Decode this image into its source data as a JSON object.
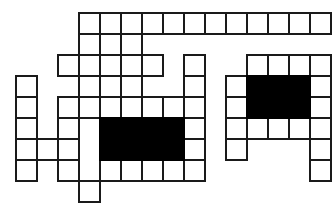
{
  "puzzle": {
    "kind": "crossword-grid",
    "title": "Blank Crossword Puzzle Grid",
    "colors": {
      "background": "#ffffff",
      "cell_fill": "#ffffff",
      "cell_border": "#1a1a1a",
      "blocked_cell": "#000000"
    },
    "geometry": {
      "image_width": 331,
      "image_height": 200,
      "cell_size": 21,
      "origin_x": 15,
      "origin_y": 12,
      "columns": 15,
      "rows": 9,
      "border_width": 2
    },
    "counts": {
      "open_cells": 66,
      "blocked_cells": 16,
      "total_drawn_cells": 82
    },
    "cells": [
      {
        "row": 0,
        "col": 3,
        "state": "open"
      },
      {
        "row": 0,
        "col": 4,
        "state": "open"
      },
      {
        "row": 0,
        "col": 5,
        "state": "open"
      },
      {
        "row": 0,
        "col": 6,
        "state": "open"
      },
      {
        "row": 0,
        "col": 7,
        "state": "open"
      },
      {
        "row": 0,
        "col": 8,
        "state": "open"
      },
      {
        "row": 0,
        "col": 9,
        "state": "open"
      },
      {
        "row": 0,
        "col": 10,
        "state": "open"
      },
      {
        "row": 0,
        "col": 11,
        "state": "open"
      },
      {
        "row": 0,
        "col": 12,
        "state": "open"
      },
      {
        "row": 0,
        "col": 13,
        "state": "open"
      },
      {
        "row": 0,
        "col": 14,
        "state": "open"
      },
      {
        "row": 1,
        "col": 3,
        "state": "open"
      },
      {
        "row": 1,
        "col": 5,
        "state": "open"
      },
      {
        "row": 2,
        "col": 2,
        "state": "open"
      },
      {
        "row": 2,
        "col": 3,
        "state": "open"
      },
      {
        "row": 2,
        "col": 4,
        "state": "open"
      },
      {
        "row": 2,
        "col": 5,
        "state": "open"
      },
      {
        "row": 2,
        "col": 6,
        "state": "open"
      },
      {
        "row": 2,
        "col": 8,
        "state": "open"
      },
      {
        "row": 2,
        "col": 11,
        "state": "open"
      },
      {
        "row": 2,
        "col": 12,
        "state": "open"
      },
      {
        "row": 2,
        "col": 13,
        "state": "open"
      },
      {
        "row": 2,
        "col": 14,
        "state": "open"
      },
      {
        "row": 3,
        "col": 0,
        "state": "open"
      },
      {
        "row": 3,
        "col": 3,
        "state": "open"
      },
      {
        "row": 3,
        "col": 5,
        "state": "open"
      },
      {
        "row": 3,
        "col": 8,
        "state": "open"
      },
      {
        "row": 3,
        "col": 10,
        "state": "open"
      },
      {
        "row": 3,
        "col": 11,
        "state": "blocked"
      },
      {
        "row": 3,
        "col": 12,
        "state": "blocked"
      },
      {
        "row": 3,
        "col": 13,
        "state": "blocked"
      },
      {
        "row": 3,
        "col": 14,
        "state": "open"
      },
      {
        "row": 4,
        "col": 0,
        "state": "open"
      },
      {
        "row": 4,
        "col": 2,
        "state": "open"
      },
      {
        "row": 4,
        "col": 3,
        "state": "open"
      },
      {
        "row": 4,
        "col": 4,
        "state": "open"
      },
      {
        "row": 4,
        "col": 5,
        "state": "open"
      },
      {
        "row": 4,
        "col": 6,
        "state": "open"
      },
      {
        "row": 4,
        "col": 7,
        "state": "open"
      },
      {
        "row": 4,
        "col": 8,
        "state": "open"
      },
      {
        "row": 4,
        "col": 10,
        "state": "open"
      },
      {
        "row": 4,
        "col": 11,
        "state": "blocked"
      },
      {
        "row": 4,
        "col": 12,
        "state": "blocked"
      },
      {
        "row": 4,
        "col": 13,
        "state": "blocked"
      },
      {
        "row": 4,
        "col": 14,
        "state": "open"
      },
      {
        "row": 5,
        "col": 0,
        "state": "open"
      },
      {
        "row": 5,
        "col": 2,
        "state": "open"
      },
      {
        "row": 5,
        "col": 4,
        "state": "blocked"
      },
      {
        "row": 5,
        "col": 5,
        "state": "blocked"
      },
      {
        "row": 5,
        "col": 6,
        "state": "blocked"
      },
      {
        "row": 5,
        "col": 7,
        "state": "blocked"
      },
      {
        "row": 5,
        "col": 8,
        "state": "open"
      },
      {
        "row": 5,
        "col": 10,
        "state": "open"
      },
      {
        "row": 5,
        "col": 11,
        "state": "open"
      },
      {
        "row": 5,
        "col": 12,
        "state": "open"
      },
      {
        "row": 5,
        "col": 13,
        "state": "open"
      },
      {
        "row": 5,
        "col": 14,
        "state": "open"
      },
      {
        "row": 6,
        "col": 0,
        "state": "open"
      },
      {
        "row": 6,
        "col": 1,
        "state": "open"
      },
      {
        "row": 6,
        "col": 2,
        "state": "open"
      },
      {
        "row": 6,
        "col": 4,
        "state": "blocked"
      },
      {
        "row": 6,
        "col": 5,
        "state": "blocked"
      },
      {
        "row": 6,
        "col": 6,
        "state": "blocked"
      },
      {
        "row": 6,
        "col": 7,
        "state": "blocked"
      },
      {
        "row": 6,
        "col": 8,
        "state": "open"
      },
      {
        "row": 6,
        "col": 10,
        "state": "open"
      },
      {
        "row": 6,
        "col": 14,
        "state": "open"
      },
      {
        "row": 7,
        "col": 0,
        "state": "open"
      },
      {
        "row": 7,
        "col": 2,
        "state": "open"
      },
      {
        "row": 7,
        "col": 4,
        "state": "open"
      },
      {
        "row": 7,
        "col": 5,
        "state": "open"
      },
      {
        "row": 7,
        "col": 6,
        "state": "open"
      },
      {
        "row": 7,
        "col": 7,
        "state": "open"
      },
      {
        "row": 7,
        "col": 8,
        "state": "open"
      },
      {
        "row": 7,
        "col": 14,
        "state": "open"
      },
      {
        "row": 8,
        "col": 3,
        "state": "open"
      }
    ]
  }
}
